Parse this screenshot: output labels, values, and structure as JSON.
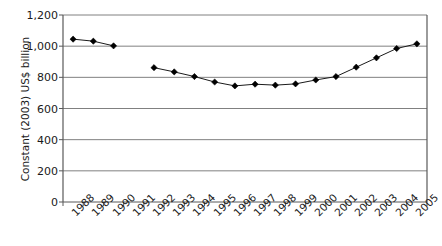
{
  "chart_data": {
    "type": "line",
    "title": "",
    "xlabel": "",
    "ylabel": "Constant (2003) US$ billion",
    "categories": [
      "1988",
      "1989",
      "1990",
      "1991",
      "1992",
      "1993",
      "1994",
      "1995",
      "1996",
      "1997",
      "1998",
      "1999",
      "2000",
      "2001",
      "2002",
      "2003",
      "2004",
      "2005"
    ],
    "values": [
      1045,
      1032,
      1002,
      null,
      862,
      835,
      805,
      770,
      745,
      756,
      750,
      758,
      783,
      805,
      865,
      925,
      985,
      1015
    ],
    "ylim": [
      0,
      1200
    ],
    "ytick_labels": [
      "0",
      "200",
      "400",
      "600",
      "800",
      "1,000",
      "1,200"
    ],
    "ytick_values": [
      0,
      200,
      400,
      600,
      800,
      1000,
      1200
    ],
    "grid": "horizontal",
    "legend": "none",
    "marker": "diamond",
    "line_color": "#1a1a1a",
    "marker_color": "#000000",
    "grid_color": "#808080",
    "axis_color": "#595959",
    "background": "#ffffff"
  }
}
